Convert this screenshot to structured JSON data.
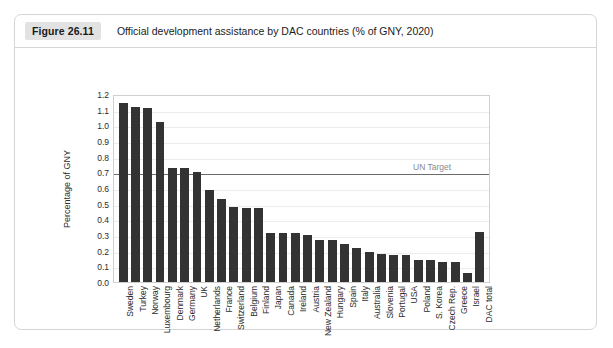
{
  "figure": {
    "number": "Figure 26.11",
    "title": "Official development assistance by DAC countries (% of GNY, 2020)"
  },
  "chart_data": {
    "type": "bar",
    "title": "Official development assistance by DAC countries (% of GNY, 2020)",
    "xlabel": "",
    "ylabel": "Percentage of GNY",
    "ylim": [
      0.0,
      1.2
    ],
    "ytick_labels": [
      "1.2",
      "1.1",
      "1.0",
      "0.9",
      "0.8",
      "0.7",
      "0.6",
      "0.5",
      "0.4",
      "0.3",
      "0.2",
      "0.1",
      "0.0"
    ],
    "ytick_values": [
      1.2,
      1.1,
      1.0,
      0.9,
      0.8,
      0.7,
      0.6,
      0.5,
      0.4,
      0.3,
      0.2,
      0.1,
      0.0
    ],
    "grid": true,
    "legend": "none",
    "bar_color": "#333333",
    "categories": [
      "Sweden",
      "Turkey",
      "Norway",
      "Luxembourg",
      "Denmark",
      "Germany",
      "UK",
      "Netherlands",
      "France",
      "Switzerland",
      "Belgium",
      "Finland",
      "Japan",
      "Canada",
      "Ireland",
      "Austria",
      "New Zealand",
      "Hungary",
      "Spain",
      "Italy",
      "Australia",
      "Slovenia",
      "Portugal",
      "USA",
      "Poland",
      "S. Korea",
      "Czech Rep.",
      "Greece",
      "Israel",
      "DAC total"
    ],
    "values": [
      1.14,
      1.12,
      1.11,
      1.02,
      0.73,
      0.73,
      0.7,
      0.59,
      0.53,
      0.48,
      0.47,
      0.47,
      0.31,
      0.31,
      0.31,
      0.3,
      0.27,
      0.27,
      0.24,
      0.22,
      0.19,
      0.18,
      0.17,
      0.17,
      0.14,
      0.14,
      0.13,
      0.13,
      0.06,
      0.32
    ],
    "annotations": [
      {
        "label": "UN Target",
        "value": 0.7,
        "type": "horizontal-line",
        "color": "#6b6b6b"
      }
    ]
  }
}
